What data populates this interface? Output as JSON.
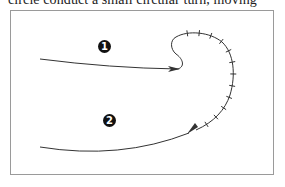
{
  "caption": {
    "text": "circle conduct a small circular turn, moving"
  },
  "figure": {
    "path_color": "#333333",
    "frame_color": "#9a9a9a",
    "markers": [
      {
        "label": "1",
        "meaning": "incoming path"
      },
      {
        "label": "2",
        "meaning": "outgoing path"
      }
    ]
  }
}
